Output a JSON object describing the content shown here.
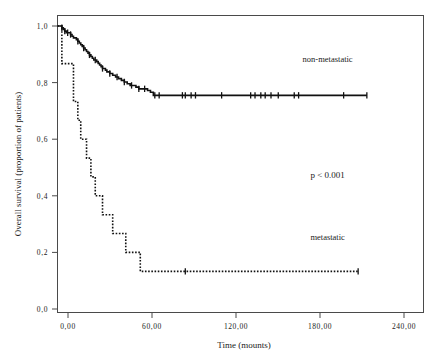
{
  "chart_data": {
    "type": "line",
    "chart_kind": "kaplan-meier-survival",
    "title": "",
    "xlabel": "Time (mounts)",
    "ylabel": "Overall survival  (proportion of patients)",
    "xlim": [
      0,
      252
    ],
    "ylim": [
      0,
      1.05
    ],
    "grid": false,
    "legend_position": "in-plot-annotations",
    "xticks": [
      0,
      60,
      120,
      180,
      240
    ],
    "xtick_labels": [
      "0,00",
      "60,00",
      "120,00",
      "180,00",
      "240,00"
    ],
    "yticks": [
      0.0,
      0.2,
      0.4,
      0.6,
      0.8,
      1.0
    ],
    "ytick_labels": [
      "0,0",
      "0,2",
      "0,4",
      "0,6",
      "0,8",
      "1,0"
    ],
    "annotations": [
      {
        "text": "non-metastatic",
        "x": 186,
        "y": 0.885
      },
      {
        "text": "p < 0.001",
        "x": 186,
        "y": 0.475
      },
      {
        "text": "metastatic",
        "x": 186,
        "y": 0.255
      }
    ],
    "series": [
      {
        "name": "non-metastatic",
        "style": "solid",
        "color": "#111111",
        "final_survival": 0.755,
        "max_followup": 213,
        "points": [
          [
            0,
            1.0
          ],
          [
            2,
            1.0
          ],
          [
            3,
            0.994
          ],
          [
            4,
            0.988
          ],
          [
            5,
            0.982
          ],
          [
            6,
            0.976
          ],
          [
            8,
            0.976
          ],
          [
            9,
            0.97
          ],
          [
            10,
            0.964
          ],
          [
            11,
            0.958
          ],
          [
            13,
            0.952
          ],
          [
            14,
            0.946
          ],
          [
            15,
            0.94
          ],
          [
            16,
            0.934
          ],
          [
            17,
            0.928
          ],
          [
            18,
            0.922
          ],
          [
            19,
            0.916
          ],
          [
            20,
            0.91
          ],
          [
            21,
            0.904
          ],
          [
            22,
            0.898
          ],
          [
            23,
            0.892
          ],
          [
            24,
            0.886
          ],
          [
            25,
            0.88
          ],
          [
            27,
            0.874
          ],
          [
            28,
            0.868
          ],
          [
            29,
            0.862
          ],
          [
            30,
            0.856
          ],
          [
            31,
            0.85
          ],
          [
            33,
            0.844
          ],
          [
            34,
            0.838
          ],
          [
            36,
            0.832
          ],
          [
            38,
            0.826
          ],
          [
            40,
            0.82
          ],
          [
            42,
            0.814
          ],
          [
            44,
            0.808
          ],
          [
            46,
            0.802
          ],
          [
            48,
            0.796
          ],
          [
            50,
            0.79
          ],
          [
            52,
            0.79
          ],
          [
            54,
            0.784
          ],
          [
            56,
            0.778
          ],
          [
            58,
            0.778
          ],
          [
            60,
            0.778
          ],
          [
            62,
            0.772
          ],
          [
            64,
            0.766
          ],
          [
            66,
            0.755
          ],
          [
            213,
            0.755
          ]
        ],
        "censor_times": [
          3,
          5,
          7,
          9,
          14,
          18,
          22,
          26,
          31,
          36,
          41,
          46,
          51,
          56,
          60,
          67,
          70,
          86,
          88,
          92,
          95,
          113,
          133,
          136,
          140,
          143,
          147,
          152,
          163,
          166,
          197,
          213
        ]
      },
      {
        "name": "metastatic",
        "style": "dotted",
        "color": "#111111",
        "final_survival": 0.133,
        "max_followup": 207,
        "points": [
          [
            0,
            1.0
          ],
          [
            3,
            1.0
          ],
          [
            3,
            0.867
          ],
          [
            11,
            0.867
          ],
          [
            11,
            0.733
          ],
          [
            14,
            0.733
          ],
          [
            14,
            0.667
          ],
          [
            16,
            0.667
          ],
          [
            16,
            0.6
          ],
          [
            20,
            0.6
          ],
          [
            20,
            0.533
          ],
          [
            23,
            0.533
          ],
          [
            23,
            0.467
          ],
          [
            26,
            0.467
          ],
          [
            26,
            0.4
          ],
          [
            31,
            0.4
          ],
          [
            31,
            0.333
          ],
          [
            38,
            0.333
          ],
          [
            38,
            0.267
          ],
          [
            47,
            0.267
          ],
          [
            47,
            0.2
          ],
          [
            57,
            0.2
          ],
          [
            57,
            0.133
          ],
          [
            207,
            0.133
          ]
        ],
        "censor_times": [
          88,
          207
        ]
      }
    ]
  },
  "axis": {
    "y_title": "Overall survival  (proportion of patients)",
    "x_title": "Time (mounts)"
  }
}
